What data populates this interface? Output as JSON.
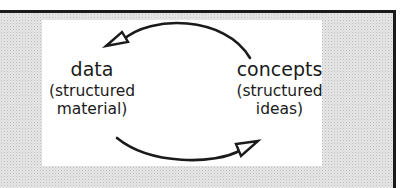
{
  "diagram": {
    "nodes": [
      {
        "id": "data",
        "title": "data",
        "subtitle_line1": "(structured",
        "subtitle_line2": "material)"
      },
      {
        "id": "concepts",
        "title": "concepts",
        "subtitle_line1": "(structured",
        "subtitle_line2": "ideas)"
      }
    ],
    "edges": [
      {
        "from": "concepts",
        "to": "data",
        "path": "upper arc",
        "arrowhead": "open-triangle"
      },
      {
        "from": "data",
        "to": "concepts",
        "path": "lower arc",
        "arrowhead": "open-triangle"
      }
    ],
    "colors": {
      "stroke": "#1a1a1a",
      "panel": "#ffffff",
      "background": "#e6e6e6"
    }
  }
}
